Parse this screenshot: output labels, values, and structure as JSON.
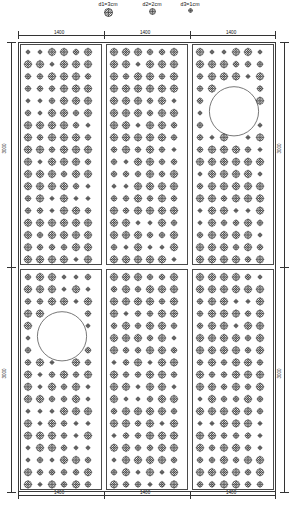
{
  "drawing": {
    "title": "Perforated Panel Layout",
    "legend": [
      {
        "id": "d1",
        "label": "d1=3cm",
        "diameter_cm": 3,
        "marker": "large-hatched-circle"
      },
      {
        "id": "d2",
        "label": "d2=2cm",
        "diameter_cm": 2,
        "marker": "medium-hatched-circle"
      },
      {
        "id": "d3",
        "label": "d3=1cm",
        "diameter_cm": 1,
        "marker": "small-hatched-circle"
      }
    ],
    "dimensions": {
      "top": [
        "1400",
        "1400",
        "1400"
      ],
      "bottom": [
        "1400",
        "1400",
        "1400"
      ],
      "left": [
        "3000",
        "3000"
      ],
      "right": [
        "3000",
        "3000"
      ],
      "unit": "mm"
    },
    "panel_grid": {
      "columns": 3,
      "rows": 2,
      "panel_width": "1400",
      "panel_height": "3000"
    },
    "cutouts": [
      {
        "panel_row": 0,
        "panel_col": 2,
        "shape": "circle",
        "note": "large circular opening"
      },
      {
        "panel_row": 1,
        "panel_col": 0,
        "shape": "circle",
        "note": "large circular opening"
      }
    ],
    "colors": {
      "line": "#3a3a3a",
      "hole_fill": "#808080",
      "background": "#ffffff",
      "dimension": "#333333"
    }
  }
}
